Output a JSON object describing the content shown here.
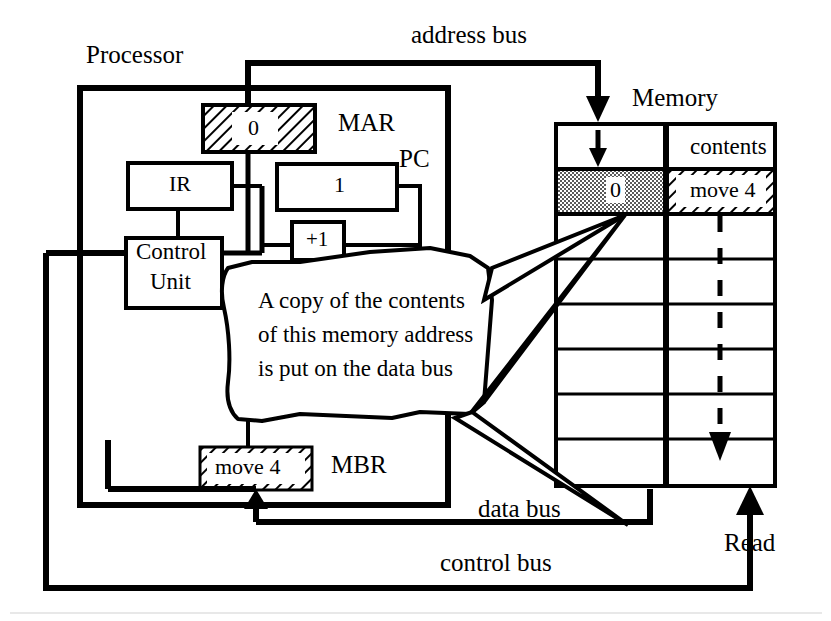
{
  "diagram": {
    "processor": {
      "label": "Processor",
      "registers": [
        {
          "name": "MAR",
          "label": "MAR",
          "value": "0",
          "fill": "hatch"
        },
        {
          "name": "IR",
          "label": "IR",
          "value": "",
          "fill": "none"
        },
        {
          "name": "PC",
          "label": "PC",
          "value": "1",
          "fill": "none"
        },
        {
          "name": "INC",
          "label": "",
          "value": "+1",
          "fill": "none"
        },
        {
          "name": "CONTROL_UNIT",
          "label": "Control Unit",
          "line1": "Control",
          "line2": "Unit",
          "value": "",
          "fill": "none"
        },
        {
          "name": "MBR",
          "label": "MBR",
          "value": "move 4",
          "fill": "hatch"
        }
      ]
    },
    "memory": {
      "label": "Memory",
      "contents_header": "contents",
      "rows": [
        {
          "address": "",
          "contents": "contents",
          "highlight": false
        },
        {
          "address": "0",
          "contents": "move 4",
          "highlight": true
        },
        {
          "address": "",
          "contents": "",
          "highlight": false
        },
        {
          "address": "",
          "contents": "",
          "highlight": false
        },
        {
          "address": "",
          "contents": "",
          "highlight": false
        },
        {
          "address": "",
          "contents": "",
          "highlight": false
        },
        {
          "address": "",
          "contents": "",
          "highlight": false
        },
        {
          "address": "",
          "contents": "",
          "highlight": false
        }
      ]
    },
    "buses": {
      "address": "address bus",
      "data": "data bus",
      "control": "control bus"
    },
    "signals": {
      "read": "Read"
    },
    "callout": {
      "line1": "A copy of the contents",
      "line2": "of this memory address",
      "line3": "is put on the data bus"
    },
    "colors": {
      "ink": "#000000",
      "paper": "#ffffff",
      "highlight_fill": "#b4b4b4"
    }
  }
}
